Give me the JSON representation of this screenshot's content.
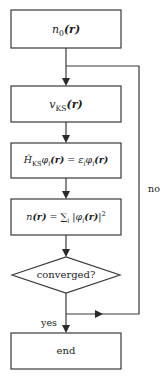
{
  "diagram": {
    "type": "flowchart",
    "nodes": [
      {
        "id": "n0",
        "shape": "rect",
        "label": "n0(r)"
      },
      {
        "id": "vks",
        "shape": "rect",
        "label": "vKS(r)"
      },
      {
        "id": "ks_eq",
        "shape": "rect",
        "label": "ĤKS φi(r) = εi φi(r)"
      },
      {
        "id": "density",
        "shape": "rect",
        "label": "n(r) = Σi |φi(r)|²"
      },
      {
        "id": "converged",
        "shape": "diamond",
        "label": "converged?"
      },
      {
        "id": "end",
        "shape": "rect",
        "label": "end"
      }
    ],
    "edges": [
      {
        "from": "n0",
        "to": "vks",
        "label": ""
      },
      {
        "from": "vks",
        "to": "ks_eq",
        "label": ""
      },
      {
        "from": "ks_eq",
        "to": "density",
        "label": ""
      },
      {
        "from": "density",
        "to": "converged",
        "label": ""
      },
      {
        "from": "converged",
        "to": "end",
        "label": "yes"
      },
      {
        "from": "converged",
        "to": "vks",
        "label": "no"
      }
    ]
  },
  "labels": {
    "n0": {
      "base": "n",
      "sub": "0",
      "arg": "(r)"
    },
    "vks": {
      "base": "v",
      "sub": "KS",
      "arg": "(r)"
    },
    "ks_eq": {
      "lhs_op": "Ĥ",
      "lhs_sub": "KS",
      "lhs_fn": "φ",
      "lhs_fn_sub": "i",
      "lhs_arg": "(r)",
      "eq": " = ",
      "rhs_eps": "ε",
      "rhs_eps_sub": "i",
      "rhs_fn": "φ",
      "rhs_fn_sub": "i",
      "rhs_arg": "(r)"
    },
    "density": {
      "lhs": "n",
      "lhs_arg": "(r)",
      "eq": " = ",
      "sum": "∑",
      "sum_sub": "i",
      "abs_open": "|",
      "fn": "φ",
      "fn_sub": "i",
      "arg": "(r)",
      "abs_close": "|",
      "power": "2"
    },
    "converged": "converged?",
    "end": "end",
    "yes": "yes",
    "no": "no"
  },
  "colors": {
    "stroke": "#3a3a3a",
    "text": "#222222",
    "background": "#ffffff"
  }
}
